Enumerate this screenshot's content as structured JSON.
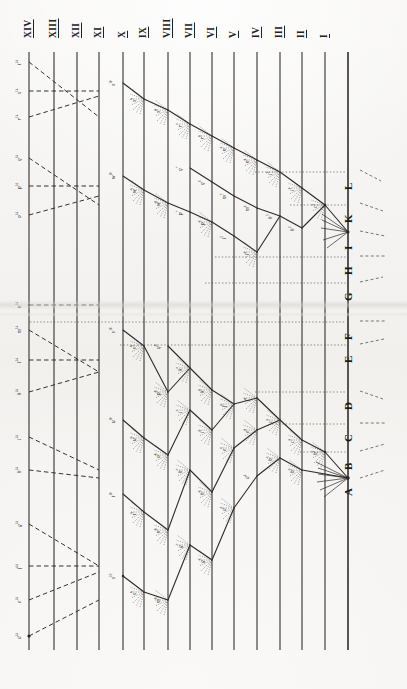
{
  "plate": {
    "title": "Genealogical descent plate",
    "background_color": "#f4f3f1",
    "ink_color": "#23211f",
    "width": 407,
    "height": 689
  },
  "generations": {
    "label_kind": "roman-numeral",
    "items": [
      {
        "numeral": "XIV",
        "x": 29
      },
      {
        "numeral": "XIII",
        "x": 54
      },
      {
        "numeral": "XII",
        "x": 77
      },
      {
        "numeral": "XI",
        "x": 99
      },
      {
        "numeral": "X",
        "x": 123
      },
      {
        "numeral": "IX",
        "x": 144
      },
      {
        "numeral": "VIII",
        "x": 168
      },
      {
        "numeral": "VII",
        "x": 190
      },
      {
        "numeral": "VI",
        "x": 212
      },
      {
        "numeral": "V",
        "x": 234
      },
      {
        "numeral": "IV",
        "x": 257
      },
      {
        "numeral": "III",
        "x": 280
      },
      {
        "numeral": "II",
        "x": 302
      },
      {
        "numeral": "I",
        "x": 325
      }
    ]
  },
  "descent_axis": {
    "x": 348,
    "letters": [
      {
        "label": "L",
        "y": 172
      },
      {
        "label": "K",
        "y": 205
      },
      {
        "label": "I",
        "y": 232
      },
      {
        "label": "H",
        "y": 257
      },
      {
        "label": "G",
        "y": 283
      },
      {
        "label": "F",
        "y": 322
      },
      {
        "label": "E",
        "y": 345
      },
      {
        "label": "D",
        "y": 392
      },
      {
        "label": "C",
        "y": 424
      },
      {
        "label": "B",
        "y": 452
      },
      {
        "label": "A",
        "y": 478
      }
    ]
  },
  "chart_data": {
    "type": "diagram",
    "subtype": "pedigree-descent-tree",
    "orientation": "rotated-90",
    "axis_ranges": {
      "line_top": 52,
      "line_bottom": 650
    },
    "sigla": [
      {
        "text": "t",
        "sup": "14",
        "x": 27,
        "y": 62
      },
      {
        "text": "s",
        "sup": "14",
        "x": 27,
        "y": 91
      },
      {
        "text": "r",
        "sup": "14",
        "x": 27,
        "y": 117
      },
      {
        "text": "q",
        "sup": "14",
        "x": 27,
        "y": 158
      },
      {
        "text": "p",
        "sup": "14",
        "x": 27,
        "y": 186
      },
      {
        "text": "o",
        "sup": "14",
        "x": 27,
        "y": 215
      },
      {
        "text": "n",
        "sup": "14",
        "x": 27,
        "y": 305
      },
      {
        "text": "m",
        "sup": "14",
        "x": 27,
        "y": 330
      },
      {
        "text": "l",
        "sup": "14",
        "x": 27,
        "y": 360
      },
      {
        "text": "k",
        "sup": "14",
        "x": 27,
        "y": 392
      },
      {
        "text": "i",
        "sup": "14",
        "x": 27,
        "y": 437
      },
      {
        "text": "h",
        "sup": "14",
        "x": 27,
        "y": 470
      },
      {
        "text": "g",
        "sup": "14",
        "x": 27,
        "y": 524
      },
      {
        "text": "f",
        "sup": "14",
        "x": 27,
        "y": 566
      },
      {
        "text": "e",
        "sup": "14",
        "x": 27,
        "y": 600
      },
      {
        "text": "d",
        "sup": "14",
        "x": 27,
        "y": 636
      },
      {
        "text": "x",
        "sup": "10",
        "x": 121,
        "y": 83
      },
      {
        "text": "w",
        "sup": "10",
        "x": 121,
        "y": 176
      },
      {
        "text": "v",
        "sup": "10",
        "x": 121,
        "y": 330
      },
      {
        "text": "u",
        "sup": "10",
        "x": 121,
        "y": 420
      },
      {
        "text": "t",
        "sup": "10",
        "x": 121,
        "y": 494
      },
      {
        "text": "s",
        "sup": "10",
        "x": 121,
        "y": 576
      },
      {
        "text": "x",
        "sup": "9",
        "x": 142,
        "y": 99
      },
      {
        "text": "w",
        "sup": "9",
        "x": 142,
        "y": 190
      },
      {
        "text": "v",
        "sup": "9",
        "x": 142,
        "y": 346
      },
      {
        "text": "u",
        "sup": "9",
        "x": 142,
        "y": 438
      },
      {
        "text": "t",
        "sup": "9",
        "x": 142,
        "y": 512
      },
      {
        "text": "s",
        "sup": "9",
        "x": 142,
        "y": 592
      },
      {
        "text": "x",
        "sup": "8",
        "x": 166,
        "y": 110
      },
      {
        "text": "w",
        "sup": "8",
        "x": 166,
        "y": 203
      },
      {
        "text": "q",
        "sup": "8",
        "x": 166,
        "y": 346
      },
      {
        "text": "p",
        "sup": "8",
        "x": 166,
        "y": 392
      },
      {
        "text": "o",
        "sup": "8",
        "x": 166,
        "y": 455
      },
      {
        "text": "n",
        "sup": "8",
        "x": 166,
        "y": 530
      },
      {
        "text": "m",
        "sup": "8",
        "x": 166,
        "y": 600
      },
      {
        "text": "r",
        "sup": "7",
        "x": 188,
        "y": 124
      },
      {
        "text": "q",
        "sup": "7",
        "x": 188,
        "y": 168
      },
      {
        "text": "p",
        "sup": "7",
        "x": 188,
        "y": 212
      },
      {
        "text": "k",
        "sup": "7",
        "x": 188,
        "y": 368
      },
      {
        "text": "i",
        "sup": "7",
        "x": 188,
        "y": 410
      },
      {
        "text": "h",
        "sup": "7",
        "x": 188,
        "y": 470
      },
      {
        "text": "g",
        "sup": "7",
        "x": 188,
        "y": 545
      },
      {
        "text": "r",
        "sup": "6",
        "x": 210,
        "y": 136
      },
      {
        "text": "q",
        "sup": "6",
        "x": 210,
        "y": 182
      },
      {
        "text": "p",
        "sup": "6",
        "x": 210,
        "y": 222
      },
      {
        "text": "k",
        "sup": "6",
        "x": 210,
        "y": 390
      },
      {
        "text": "i",
        "sup": "6",
        "x": 210,
        "y": 430
      },
      {
        "text": "h",
        "sup": "6",
        "x": 210,
        "y": 492
      },
      {
        "text": "g",
        "sup": "6",
        "x": 210,
        "y": 560
      },
      {
        "text": "n",
        "sup": "5",
        "x": 232,
        "y": 148
      },
      {
        "text": "m",
        "sup": "5",
        "x": 232,
        "y": 196
      },
      {
        "text": "l",
        "sup": "5",
        "x": 232,
        "y": 236
      },
      {
        "text": "f",
        "sup": "5",
        "x": 232,
        "y": 404
      },
      {
        "text": "e",
        "sup": "5",
        "x": 232,
        "y": 448
      },
      {
        "text": "d",
        "sup": "5",
        "x": 232,
        "y": 508
      },
      {
        "text": "n",
        "sup": "4",
        "x": 255,
        "y": 160
      },
      {
        "text": "m",
        "sup": "4",
        "x": 255,
        "y": 208
      },
      {
        "text": "l",
        "sup": "4",
        "x": 255,
        "y": 252
      },
      {
        "text": "f",
        "sup": "4",
        "x": 255,
        "y": 398
      },
      {
        "text": "e",
        "sup": "4",
        "x": 255,
        "y": 430
      },
      {
        "text": "d",
        "sup": "4",
        "x": 255,
        "y": 476
      },
      {
        "text": "i",
        "sup": "3",
        "x": 278,
        "y": 172
      },
      {
        "text": "h",
        "sup": "3",
        "x": 278,
        "y": 216
      },
      {
        "text": "c",
        "sup": "3",
        "x": 278,
        "y": 420
      },
      {
        "text": "b",
        "sup": "3",
        "x": 278,
        "y": 458
      },
      {
        "text": "i",
        "sup": "2",
        "x": 300,
        "y": 188
      },
      {
        "text": "h",
        "sup": "2",
        "x": 300,
        "y": 228
      },
      {
        "text": "c",
        "sup": "2",
        "x": 300,
        "y": 440
      },
      {
        "text": "b",
        "sup": "2",
        "x": 300,
        "y": 470
      },
      {
        "text": "c",
        "sup": "1",
        "x": 323,
        "y": 205
      },
      {
        "text": "b",
        "sup": "1",
        "x": 323,
        "y": 452
      }
    ]
  }
}
